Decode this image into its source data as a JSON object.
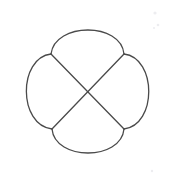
{
  "figure": {
    "name": "quatrefoil-with-diagonals",
    "background_color": "#ffffff",
    "stroke_color": "#4a4a4a",
    "stroke_width": 1.3,
    "canvas": {
      "width": 174,
      "height": 180
    },
    "center": {
      "x": 88,
      "y": 92
    },
    "junctions": [
      {
        "name": "top-left-junction",
        "x": 51,
        "y": 54
      },
      {
        "name": "top-right-junction",
        "x": 124,
        "y": 54
      },
      {
        "name": "bottom-right-junction",
        "x": 124,
        "y": 129
      },
      {
        "name": "bottom-left-junction",
        "x": 52,
        "y": 129
      }
    ],
    "extents": {
      "top_y": 18,
      "bottom_y": 163,
      "left_x": 14,
      "right_x": 160
    },
    "arcs": [
      {
        "name": "top-petal-arc",
        "path": "M 51 54 C 55 22 121 22 124 54",
        "bulge_direction": "up",
        "apex": {
          "x": 88,
          "y": 18
        }
      },
      {
        "name": "right-petal-arc",
        "path": "M 124 54 C 157 58 157 125 124 129",
        "bulge_direction": "right",
        "apex": {
          "x": 160,
          "y": 92
        }
      },
      {
        "name": "bottom-petal-arc",
        "path": "M 124 129 C 121 161 55 161 52 129",
        "bulge_direction": "down",
        "apex": {
          "x": 88,
          "y": 163
        }
      },
      {
        "name": "left-petal-arc",
        "path": "M 52 129 C 18 125 18 58 51 54",
        "bulge_direction": "left",
        "apex": {
          "x": 14,
          "y": 92
        }
      }
    ],
    "diagonals": [
      {
        "name": "diagonal-top-left-to-bottom-right",
        "x1": 51,
        "y1": 54,
        "x2": 124,
        "y2": 129
      },
      {
        "name": "diagonal-top-right-to-bottom-left",
        "x1": 124,
        "y1": 54,
        "x2": 52,
        "y2": 129
      }
    ],
    "specks": [
      {
        "name": "speck-upper-right-1",
        "cx": 155,
        "cy": 13,
        "r": 1.6
      },
      {
        "name": "speck-upper-right-2",
        "cx": 158,
        "cy": 25,
        "r": 1.3
      },
      {
        "name": "speck-upper-right-3",
        "cx": 154,
        "cy": 28,
        "r": 1.0
      },
      {
        "name": "speck-lower-right-1",
        "cx": 152,
        "cy": 171,
        "r": 1.2
      }
    ]
  }
}
